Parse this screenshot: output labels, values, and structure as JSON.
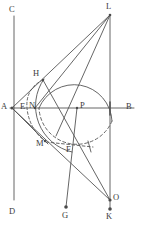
{
  "figure": {
    "type": "geometry-diagram",
    "width": 144,
    "height": 226,
    "background": "#ffffff",
    "stroke_color": "#555555",
    "label_color": "#3b3b3b",
    "points": [
      {
        "name": "C",
        "label": "C",
        "x": 14,
        "y": 16,
        "label_x": 9,
        "label_y": 5,
        "dot": false
      },
      {
        "name": "D",
        "label": "D",
        "x": 14,
        "y": 200,
        "label_x": 9,
        "label_y": 208,
        "dot": false
      },
      {
        "name": "A",
        "label": "A",
        "x": 12,
        "y": 108,
        "label_x": 1,
        "label_y": 103,
        "dot": true
      },
      {
        "name": "B",
        "label": "B",
        "x": 134,
        "y": 108,
        "label_x": 126,
        "label_y": 103,
        "dot": false
      },
      {
        "name": "L",
        "label": "L",
        "x": 110,
        "y": 15,
        "label_x": 106,
        "label_y": 3,
        "dot": true
      },
      {
        "name": "K",
        "label": "K",
        "x": 110,
        "y": 209,
        "label_x": 106,
        "label_y": 212,
        "dot": true
      },
      {
        "name": "O",
        "label": "O",
        "x": 110,
        "y": 200,
        "label_x": 112,
        "label_y": 195,
        "dot": true
      },
      {
        "name": "H",
        "label": "H",
        "x": 43,
        "y": 80,
        "label_x": 33,
        "label_y": 70,
        "dot": true
      },
      {
        "name": "P",
        "label": "P",
        "x": 77,
        "y": 108,
        "label_x": 79,
        "label_y": 103,
        "dot": true
      },
      {
        "name": "E",
        "label": "E",
        "x": 26,
        "y": 108,
        "label_x": 21,
        "label_y": 103,
        "dot": false
      },
      {
        "name": "N",
        "label": "N",
        "x": 35,
        "y": 108,
        "label_x": 30,
        "label_y": 102,
        "dot": true
      },
      {
        "name": "M",
        "label": "M",
        "x": 45,
        "y": 141,
        "label_x": 37,
        "label_y": 140,
        "dot": true
      },
      {
        "name": "F",
        "label": "F",
        "x": 70,
        "y": 150,
        "label_x": 67,
        "label_y": 146,
        "dot": false
      },
      {
        "name": "G",
        "label": "G",
        "x": 66,
        "y": 207,
        "label_x": 62,
        "label_y": 211,
        "dot": true
      }
    ],
    "segments": [
      {
        "name": "vertical-line-CD",
        "x1": 14,
        "y1": 16,
        "x2": 14,
        "y2": 200,
        "dashed": false
      },
      {
        "name": "horizontal-line-AB",
        "x1": 10,
        "y1": 108,
        "x2": 134,
        "y2": 108,
        "dashed": false
      },
      {
        "name": "vertical-line-LK",
        "x1": 110,
        "y1": 15,
        "x2": 110,
        "y2": 209,
        "dashed": false
      },
      {
        "name": "vertical-line-PG",
        "x1": 77,
        "y1": 108,
        "x2": 66,
        "y2": 207,
        "dashed": false
      },
      {
        "name": "segment-A-L",
        "x1": 12,
        "y1": 108,
        "x2": 110,
        "y2": 15,
        "dashed": false
      },
      {
        "name": "segment-A-O",
        "x1": 12,
        "y1": 108,
        "x2": 110,
        "y2": 200,
        "dashed": false
      },
      {
        "name": "segment-L-P",
        "x1": 110,
        "y1": 15,
        "x2": 55,
        "y2": 137,
        "dashed": false
      },
      {
        "name": "segment-H-O",
        "x1": 43,
        "y1": 80,
        "x2": 110,
        "y2": 200,
        "dashed": false
      },
      {
        "name": "segment-N-L",
        "x1": 35,
        "y1": 108,
        "x2": 110,
        "y2": 15,
        "dashed": false
      },
      {
        "name": "segment-A-H",
        "x1": 12,
        "y1": 108,
        "x2": 47,
        "y2": 76,
        "dashed": false
      },
      {
        "name": "segment-A-M",
        "x1": 12,
        "y1": 108,
        "x2": 45,
        "y2": 141,
        "dashed": false
      },
      {
        "name": "segment-M-F-tick",
        "x1": 45,
        "y1": 141,
        "x2": 92,
        "y2": 146,
        "dashed": true
      }
    ],
    "arcs": [
      {
        "name": "main-circle-upper-arc",
        "cx": 77,
        "cy": 108,
        "r": 38,
        "start_deg": 180,
        "end_deg": 340,
        "dashed": false
      },
      {
        "name": "main-circle-lower-arc",
        "cx": 77,
        "cy": 108,
        "r": 38,
        "start_deg": 20,
        "end_deg": 180,
        "dashed": true
      },
      {
        "name": "arc-through-N-ellipse",
        "dashed": true
      },
      {
        "name": "arc-H-to-F-solid",
        "dashed": false
      }
    ]
  }
}
